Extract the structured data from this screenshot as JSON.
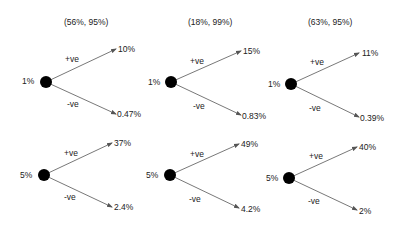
{
  "columns": [
    {
      "header": "(56%, 95%)",
      "trees": [
        {
          "root": "1%",
          "up_label": "+ve",
          "down_label": "-ve",
          "up_value": "10%",
          "down_value": "0.47%"
        },
        {
          "root": "5%",
          "up_label": "+ve",
          "down_label": "-ve",
          "up_value": "37%",
          "down_value": "2.4%"
        }
      ]
    },
    {
      "header": "(18%, 99%)",
      "trees": [
        {
          "root": "1%",
          "up_label": "+ve",
          "down_label": "-ve",
          "up_value": "15%",
          "down_value": "0.83%"
        },
        {
          "root": "5%",
          "up_label": "+ve",
          "down_label": "-ve",
          "up_value": "49%",
          "down_value": "4.2%"
        }
      ]
    },
    {
      "header": "(63%, 95%)",
      "trees": [
        {
          "root": "1%",
          "up_label": "+ve",
          "down_label": "-ve",
          "up_value": "11%",
          "down_value": "0.39%"
        },
        {
          "root": "5%",
          "up_label": "+ve",
          "down_label": "-ve",
          "up_value": "40%",
          "down_value": "2%"
        }
      ]
    }
  ],
  "colors": {
    "node": "#000000",
    "arrow": "#555555",
    "text": "#222222"
  }
}
